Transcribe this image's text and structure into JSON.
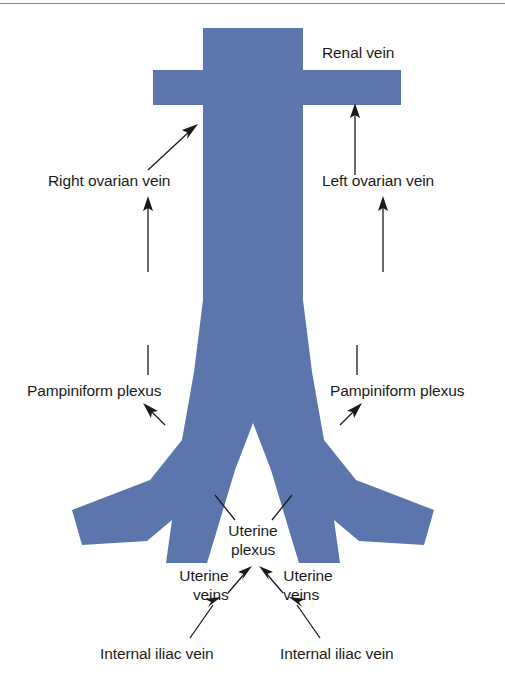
{
  "figure": {
    "background_color": "#ffffff",
    "vessel_color": "#5b76ad",
    "label_color": "#1b1b1b",
    "leader_color": "#1a1a1a",
    "top_rule_color": "#8a8a8a"
  },
  "labels": {
    "renal_vein": "Renal vein",
    "right_ovarian_vein": "Right ovarian vein",
    "left_ovarian_vein": "Left ovarian vein",
    "pampiniform_plexus_left": "Pampiniform plexus",
    "pampiniform_plexus_right": "Pampiniform plexus",
    "uterine_plexus_line1": "Uterine",
    "uterine_plexus_line2": "plexus",
    "uterine_veins_left_line1": "Uterine",
    "uterine_veins_left_line2": "veins",
    "uterine_veins_right_line1": "Uterine",
    "uterine_veins_right_line2": "veins",
    "internal_iliac_vein_left": "Internal iliac vein",
    "internal_iliac_vein_right": "Internal iliac vein"
  }
}
